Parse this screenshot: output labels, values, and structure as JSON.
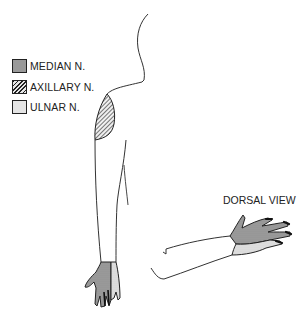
{
  "legend": {
    "items": [
      {
        "label": "MEDIAN N.",
        "pattern": "solid-gray",
        "color": "#9a9a9a"
      },
      {
        "label": "AXILLARY N.",
        "pattern": "diagonal-hatch",
        "color": "#222222"
      },
      {
        "label": "ULNAR N.",
        "pattern": "light-stipple",
        "color": "#e4e4e4"
      }
    ]
  },
  "annotations": {
    "dorsal_view": "DORSAL VIEW"
  },
  "colors": {
    "outline": "#333333",
    "median": "#9a9a9a",
    "ulnar": "#e4e4e4",
    "background": "#ffffff"
  }
}
